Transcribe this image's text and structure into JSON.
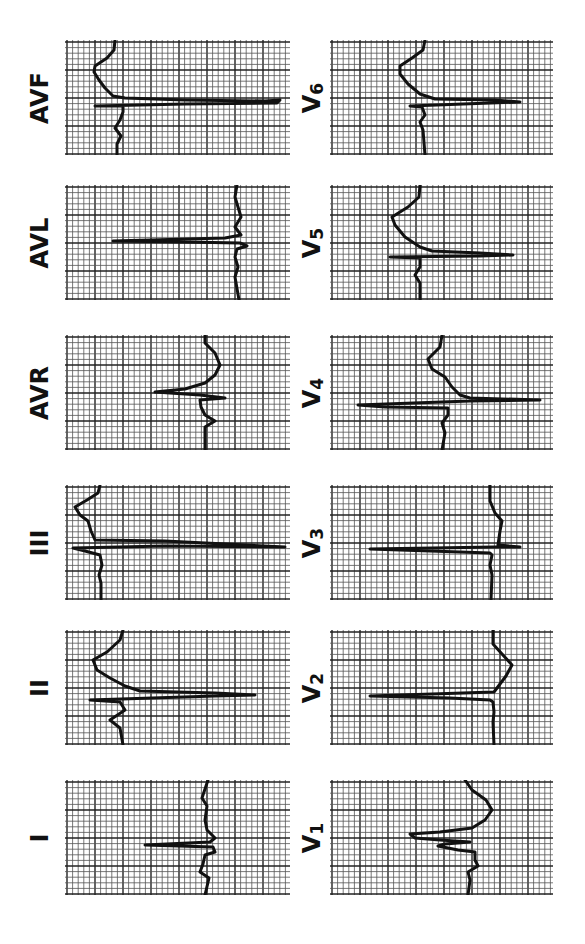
{
  "figure": {
    "orientation": "rotated -90deg",
    "colors": {
      "background": "#ffffff",
      "grid_minor": "#555555",
      "grid_major": "#222222",
      "trace": "#111111"
    }
  },
  "leads": [
    {
      "id": "AVF",
      "label": "AVF",
      "col": 0,
      "row": 0,
      "box": [
        65,
        40,
        225,
        115
      ],
      "trace": [
        [
          50,
          0
        ],
        [
          49,
          10
        ],
        [
          42,
          18
        ],
        [
          30,
          26
        ],
        [
          29,
          32
        ],
        [
          34,
          40
        ],
        [
          40,
          48
        ],
        [
          48,
          56
        ],
        [
          60,
          58
        ],
        [
          120,
          60
        ],
        [
          200,
          61
        ],
        [
          215,
          60
        ],
        [
          212,
          63
        ],
        [
          120,
          64
        ],
        [
          30,
          66
        ],
        [
          58,
          66
        ],
        [
          58,
          72
        ],
        [
          55,
          80
        ],
        [
          50,
          88
        ],
        [
          56,
          96
        ],
        [
          52,
          104
        ],
        [
          52,
          115
        ]
      ]
    },
    {
      "id": "AVL",
      "label": "AVL",
      "col": 0,
      "row": 1,
      "box": [
        65,
        185,
        225,
        115
      ],
      "trace": [
        [
          172,
          0
        ],
        [
          170,
          12
        ],
        [
          173,
          22
        ],
        [
          176,
          32
        ],
        [
          170,
          42
        ],
        [
          176,
          50
        ],
        [
          160,
          53
        ],
        [
          48,
          56
        ],
        [
          120,
          57
        ],
        [
          175,
          58
        ],
        [
          182,
          61
        ],
        [
          172,
          64
        ],
        [
          170,
          72
        ],
        [
          173,
          82
        ],
        [
          170,
          92
        ],
        [
          174,
          115
        ]
      ]
    },
    {
      "id": "AVR",
      "label": "AVR",
      "col": 0,
      "row": 2,
      "box": [
        65,
        335,
        225,
        115
      ],
      "trace": [
        [
          140,
          0
        ],
        [
          140,
          8
        ],
        [
          150,
          18
        ],
        [
          155,
          30
        ],
        [
          150,
          40
        ],
        [
          140,
          48
        ],
        [
          120,
          54
        ],
        [
          90,
          57
        ],
        [
          135,
          60
        ],
        [
          160,
          63
        ],
        [
          135,
          65
        ],
        [
          136,
          72
        ],
        [
          140,
          80
        ],
        [
          150,
          86
        ],
        [
          140,
          92
        ],
        [
          140,
          115
        ]
      ]
    },
    {
      "id": "III",
      "label": "III",
      "col": 0,
      "row": 3,
      "box": [
        65,
        485,
        225,
        115
      ],
      "trace": [
        [
          35,
          0
        ],
        [
          33,
          8
        ],
        [
          22,
          15
        ],
        [
          10,
          22
        ],
        [
          15,
          30
        ],
        [
          23,
          36
        ],
        [
          26,
          46
        ],
        [
          30,
          55
        ],
        [
          100,
          56
        ],
        [
          220,
          62
        ],
        [
          100,
          61
        ],
        [
          8,
          63
        ],
        [
          20,
          66
        ],
        [
          35,
          70
        ],
        [
          37,
          80
        ],
        [
          34,
          90
        ],
        [
          36,
          98
        ],
        [
          36,
          115
        ]
      ]
    },
    {
      "id": "II",
      "label": "II",
      "col": 0,
      "row": 4,
      "box": [
        65,
        630,
        225,
        115
      ],
      "trace": [
        [
          58,
          0
        ],
        [
          55,
          10
        ],
        [
          42,
          22
        ],
        [
          28,
          30
        ],
        [
          32,
          40
        ],
        [
          45,
          48
        ],
        [
          60,
          56
        ],
        [
          75,
          61
        ],
        [
          150,
          63
        ],
        [
          190,
          65
        ],
        [
          150,
          66
        ],
        [
          25,
          70
        ],
        [
          55,
          72
        ],
        [
          60,
          80
        ],
        [
          45,
          90
        ],
        [
          55,
          98
        ],
        [
          58,
          115
        ]
      ]
    },
    {
      "id": "I",
      "label": "I",
      "col": 0,
      "row": 5,
      "box": [
        65,
        780,
        225,
        115
      ],
      "trace": [
        [
          143,
          0
        ],
        [
          137,
          18
        ],
        [
          142,
          26
        ],
        [
          140,
          40
        ],
        [
          142,
          50
        ],
        [
          150,
          58
        ],
        [
          145,
          62
        ],
        [
          80,
          65
        ],
        [
          148,
          67
        ],
        [
          150,
          72
        ],
        [
          140,
          75
        ],
        [
          138,
          84
        ],
        [
          135,
          92
        ],
        [
          144,
          98
        ],
        [
          140,
          115
        ]
      ]
    },
    {
      "id": "V6",
      "label": "V6",
      "col": 1,
      "row": 0,
      "box": [
        330,
        40,
        223,
        115
      ],
      "trace": [
        [
          95,
          0
        ],
        [
          93,
          10
        ],
        [
          82,
          18
        ],
        [
          70,
          26
        ],
        [
          70,
          34
        ],
        [
          78,
          44
        ],
        [
          90,
          54
        ],
        [
          105,
          59
        ],
        [
          165,
          60
        ],
        [
          190,
          62
        ],
        [
          160,
          63
        ],
        [
          80,
          66
        ],
        [
          92,
          67
        ],
        [
          95,
          75
        ],
        [
          90,
          82
        ],
        [
          93,
          90
        ],
        [
          95,
          115
        ]
      ]
    },
    {
      "id": "V5",
      "label": "V5",
      "col": 1,
      "row": 1,
      "box": [
        330,
        185,
        223,
        115
      ],
      "trace": [
        [
          90,
          0
        ],
        [
          89,
          12
        ],
        [
          78,
          22
        ],
        [
          62,
          32
        ],
        [
          65,
          40
        ],
        [
          75,
          52
        ],
        [
          90,
          62
        ],
        [
          102,
          66
        ],
        [
          150,
          68
        ],
        [
          183,
          70
        ],
        [
          150,
          71
        ],
        [
          60,
          72
        ],
        [
          90,
          73
        ],
        [
          90,
          82
        ],
        [
          85,
          90
        ],
        [
          90,
          98
        ],
        [
          90,
          115
        ]
      ]
    },
    {
      "id": "V4",
      "label": "V4",
      "col": 1,
      "row": 2,
      "box": [
        330,
        335,
        223,
        115
      ],
      "trace": [
        [
          112,
          0
        ],
        [
          110,
          12
        ],
        [
          98,
          24
        ],
        [
          102,
          34
        ],
        [
          115,
          42
        ],
        [
          122,
          52
        ],
        [
          130,
          60
        ],
        [
          140,
          63
        ],
        [
          210,
          65
        ],
        [
          140,
          66
        ],
        [
          28,
          70
        ],
        [
          55,
          72
        ],
        [
          118,
          73
        ],
        [
          118,
          80
        ],
        [
          112,
          88
        ],
        [
          115,
          98
        ],
        [
          112,
          115
        ]
      ]
    },
    {
      "id": "V3",
      "label": "V3",
      "col": 1,
      "row": 3,
      "box": [
        330,
        485,
        223,
        115
      ],
      "trace": [
        [
          160,
          0
        ],
        [
          160,
          16
        ],
        [
          165,
          28
        ],
        [
          172,
          36
        ],
        [
          170,
          46
        ],
        [
          168,
          60
        ],
        [
          190,
          62
        ],
        [
          165,
          62
        ],
        [
          40,
          64
        ],
        [
          160,
          68
        ],
        [
          162,
          70
        ],
        [
          160,
          80
        ],
        [
          162,
          90
        ],
        [
          161,
          115
        ]
      ]
    },
    {
      "id": "V2",
      "label": "V2",
      "col": 1,
      "row": 4,
      "box": [
        330,
        630,
        223,
        115
      ],
      "trace": [
        [
          163,
          0
        ],
        [
          163,
          14
        ],
        [
          172,
          24
        ],
        [
          182,
          35
        ],
        [
          176,
          46
        ],
        [
          170,
          54
        ],
        [
          164,
          62
        ],
        [
          40,
          66
        ],
        [
          120,
          68
        ],
        [
          160,
          70
        ],
        [
          163,
          72
        ],
        [
          164,
          82
        ],
        [
          163,
          92
        ],
        [
          164,
          115
        ]
      ]
    },
    {
      "id": "V1",
      "label": "V1",
      "col": 1,
      "row": 5,
      "box": [
        330,
        780,
        223,
        115
      ],
      "trace": [
        [
          135,
          0
        ],
        [
          142,
          10
        ],
        [
          156,
          20
        ],
        [
          162,
          30
        ],
        [
          155,
          40
        ],
        [
          142,
          48
        ],
        [
          110,
          52
        ],
        [
          80,
          54
        ],
        [
          85,
          58
        ],
        [
          110,
          60
        ],
        [
          140,
          62
        ],
        [
          115,
          64
        ],
        [
          108,
          66
        ],
        [
          128,
          70
        ],
        [
          145,
          72
        ],
        [
          145,
          80
        ],
        [
          148,
          86
        ],
        [
          138,
          92
        ],
        [
          140,
          100
        ],
        [
          138,
          115
        ]
      ]
    }
  ]
}
